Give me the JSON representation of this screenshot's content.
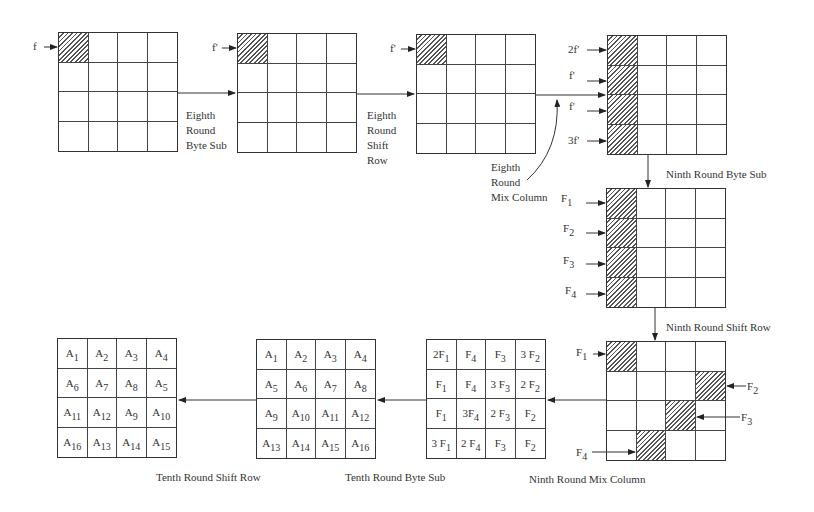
{
  "diagram": {
    "type": "AES fault propagation diagram",
    "grids": [
      {
        "id": "g1",
        "x": 58,
        "y": 32,
        "hatched": [
          0
        ],
        "cells": []
      },
      {
        "id": "g2",
        "x": 237,
        "y": 33,
        "hatched": [
          0
        ],
        "cells": []
      },
      {
        "id": "g3",
        "x": 416,
        "y": 34,
        "hatched": [
          0
        ],
        "cells": []
      },
      {
        "id": "g4",
        "x": 607,
        "y": 35,
        "hatched": [
          0,
          4,
          8,
          12
        ],
        "cells": []
      },
      {
        "id": "g5",
        "x": 606,
        "y": 188,
        "hatched": [
          0,
          4,
          8,
          12
        ],
        "cells": []
      },
      {
        "id": "g6",
        "x": 606,
        "y": 341,
        "hatched": [
          0,
          7,
          10,
          13
        ],
        "cells": []
      },
      {
        "id": "g7",
        "x": 426,
        "y": 339,
        "hatched": [],
        "cells": [
          [
            "2F",
            "1"
          ],
          [
            "F",
            "4"
          ],
          [
            "F",
            "3"
          ],
          [
            "3 F",
            "2"
          ],
          [
            "F",
            "1"
          ],
          [
            "F",
            "4"
          ],
          [
            "3 F",
            "3"
          ],
          [
            "2 F",
            "2"
          ],
          [
            "F",
            "1"
          ],
          [
            "3F",
            "4"
          ],
          [
            "2 F",
            "3"
          ],
          [
            "F",
            "2"
          ],
          [
            "3 F",
            "1"
          ],
          [
            "2 F",
            "4"
          ],
          [
            "F",
            "3"
          ],
          [
            "F",
            "2"
          ]
        ]
      },
      {
        "id": "g8",
        "x": 256,
        "y": 339,
        "hatched": [],
        "cells": [
          [
            "A",
            "1"
          ],
          [
            "A",
            "2"
          ],
          [
            "A",
            "3"
          ],
          [
            "A",
            "4"
          ],
          [
            "A",
            "5"
          ],
          [
            "A",
            "6"
          ],
          [
            "A",
            "7"
          ],
          [
            "A",
            "8"
          ],
          [
            "A",
            "9"
          ],
          [
            "A",
            "10"
          ],
          [
            "A",
            "11"
          ],
          [
            "A",
            "12"
          ],
          [
            "A",
            "13"
          ],
          [
            "A",
            "14"
          ],
          [
            "A",
            "15"
          ],
          [
            "A",
            "16"
          ]
        ]
      },
      {
        "id": "g9",
        "x": 57,
        "y": 338,
        "hatched": [],
        "cells": [
          [
            "A",
            "1"
          ],
          [
            "A",
            "2"
          ],
          [
            "A",
            "3"
          ],
          [
            "A",
            "4"
          ],
          [
            "A",
            "6"
          ],
          [
            "A",
            "7"
          ],
          [
            "A",
            "8"
          ],
          [
            "A",
            "5"
          ],
          [
            "A",
            "11"
          ],
          [
            "A",
            "12"
          ],
          [
            "A",
            "9"
          ],
          [
            "A",
            "10"
          ],
          [
            "A",
            "16"
          ],
          [
            "A",
            "13"
          ],
          [
            "A",
            "14"
          ],
          [
            "A",
            "15"
          ]
        ]
      }
    ],
    "stage_labels": {
      "eighth_byte_sub": [
        "Eighth",
        "Round",
        "Byte Sub"
      ],
      "eighth_shift_row": [
        "Eighth",
        "Round",
        "Shift",
        "Row"
      ],
      "eighth_mix_column": [
        "Eighth",
        "Round",
        "Mix Column"
      ],
      "ninth_byte_sub": "Ninth Round Byte Sub",
      "ninth_shift_row": "Ninth Round Shift Row",
      "ninth_mix_column": "Ninth Round Mix Column",
      "tenth_byte_sub": "Tenth Round Byte Sub",
      "tenth_shift_row": "Tenth Round Shift Row"
    },
    "input_labels": {
      "g1": "f",
      "g2": "f'",
      "g3": "f'",
      "g4": [
        "2f'",
        "f'",
        "f'",
        "3f'"
      ],
      "g5": [
        [
          "F",
          "1"
        ],
        [
          "F",
          "2"
        ],
        [
          "F",
          "3"
        ],
        [
          "F",
          "4"
        ]
      ],
      "g6": [
        [
          "F",
          "1"
        ],
        [
          "F",
          "2"
        ],
        [
          "F",
          "3"
        ],
        [
          "F",
          "4"
        ]
      ]
    }
  }
}
